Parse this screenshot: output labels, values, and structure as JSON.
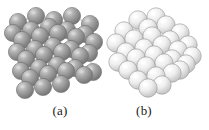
{
  "figure": {
    "background_color": "#ffffff",
    "panels": [
      {
        "id": "a",
        "caption": "(a)",
        "arrangement": "crystalline",
        "description": "ordered cubic lattice of spheres",
        "sphere_fill": "#9a9a9a",
        "sphere_edge": "#6e6e6e",
        "sphere_highlight": "#d8d8d8",
        "lattice_line_color": "#b4b4b4",
        "sphere_count": 36
      },
      {
        "id": "b",
        "caption": "(b)",
        "arrangement": "amorphous",
        "description": "disordered random cluster of spheres",
        "sphere_fill": "#ededed",
        "sphere_edge": "#9b9b9b",
        "sphere_highlight": "#ffffff",
        "sphere_count": 30
      }
    ]
  },
  "chart_data": {
    "type": "scatter",
    "title": "",
    "xlabel": "",
    "ylabel": "",
    "grid": false,
    "legend": null,
    "annotations": [
      "(a)",
      "(b)"
    ],
    "series": [
      {
        "name": "crystalline-lattice-spheres",
        "panel": "a",
        "radius": 8.6,
        "x": [
          18,
          36,
          54,
          72,
          90,
          13,
          31,
          49,
          67,
          85,
          22,
          40,
          58,
          76,
          94,
          17,
          35,
          53,
          71,
          89,
          26,
          44,
          62,
          80,
          21,
          39,
          57,
          75,
          93,
          30,
          48,
          66,
          84,
          25,
          43,
          61
        ],
        "y": [
          22,
          16,
          20,
          16,
          24,
          33,
          30,
          27,
          30,
          34,
          40,
          36,
          33,
          37,
          42,
          52,
          49,
          46,
          49,
          53,
          59,
          55,
          52,
          56,
          71,
          68,
          65,
          68,
          72,
          78,
          74,
          71,
          75,
          90,
          87,
          84
        ]
      },
      {
        "name": "amorphous-cluster-spheres",
        "panel": "b",
        "radius": 9.2,
        "x": [
          34,
          52,
          20,
          44,
          62,
          76,
          12,
          30,
          48,
          66,
          84,
          22,
          40,
          58,
          74,
          88,
          14,
          32,
          50,
          68,
          82,
          24,
          42,
          60,
          76,
          34,
          52,
          68,
          44,
          58
        ],
        "y": [
          20,
          17,
          31,
          28,
          25,
          33,
          43,
          39,
          36,
          40,
          45,
          52,
          48,
          45,
          50,
          56,
          62,
          58,
          55,
          59,
          64,
          70,
          66,
          63,
          70,
          80,
          76,
          73,
          88,
          85
        ]
      }
    ]
  }
}
